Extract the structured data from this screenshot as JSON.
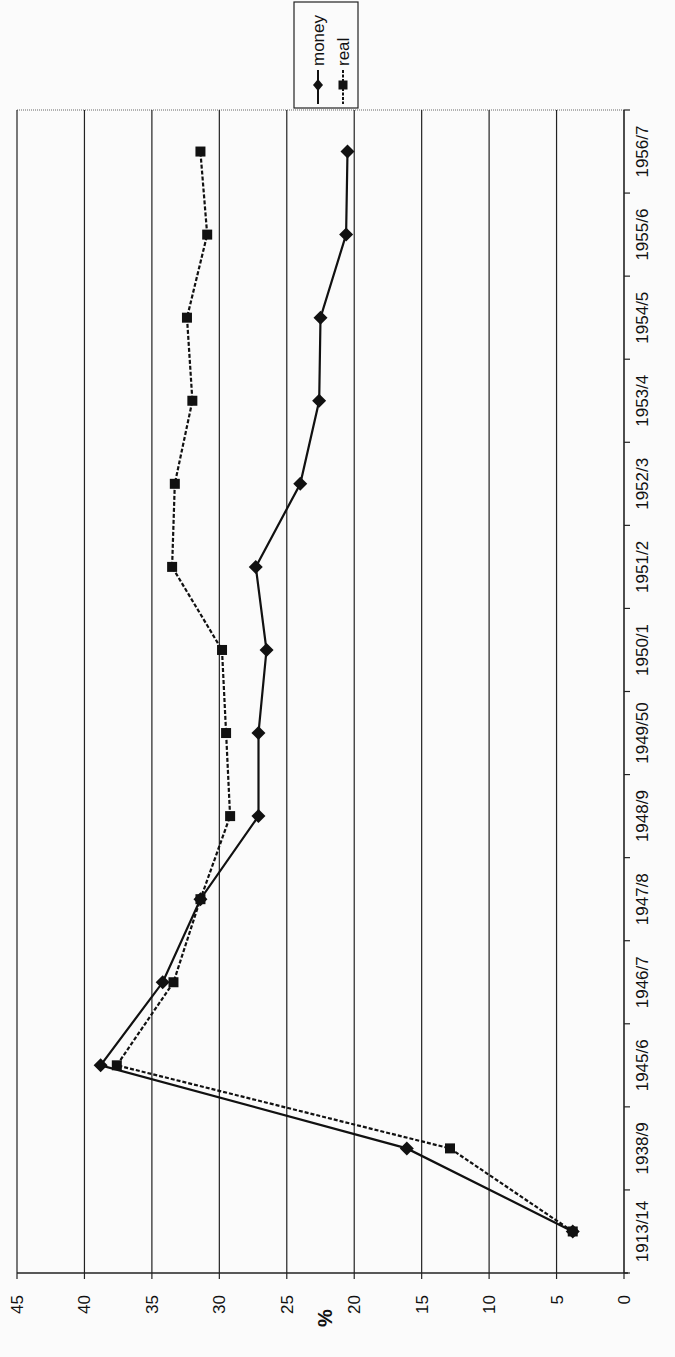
{
  "chart_data": {
    "type": "line",
    "orientation": "rotated-90-clockwise",
    "title": "",
    "xlabel": "",
    "ylabel": "%",
    "ylim": [
      0,
      45
    ],
    "yticks": [
      0,
      5,
      10,
      15,
      20,
      25,
      30,
      35,
      40,
      45
    ],
    "grid": true,
    "legend_position": "top-right (rotated)",
    "categories": [
      "1913/14",
      "1938/9",
      "1945/6",
      "1946/7",
      "1947/8",
      "1948/9",
      "1949/50",
      "1950/1",
      "1951/2",
      "1952/3",
      "1953/4",
      "1954/5",
      "1955/6",
      "1956/7"
    ],
    "series": [
      {
        "name": "money",
        "marker": "diamond",
        "line": "solid",
        "color": "#111111",
        "values": [
          3.8,
          16.1,
          38.8,
          34.2,
          31.4,
          27.1,
          27.1,
          26.5,
          27.3,
          24.0,
          22.6,
          22.5,
          20.6,
          20.5
        ]
      },
      {
        "name": "real",
        "marker": "square",
        "line": "dashed",
        "color": "#111111",
        "values": [
          3.8,
          12.9,
          37.6,
          33.4,
          31.4,
          29.2,
          29.5,
          29.8,
          33.5,
          33.3,
          32.0,
          32.4,
          30.9,
          31.4
        ]
      }
    ]
  },
  "legend": {
    "items": [
      {
        "label": "money"
      },
      {
        "label": "real"
      }
    ]
  },
  "axis": {
    "value_title": "%"
  }
}
